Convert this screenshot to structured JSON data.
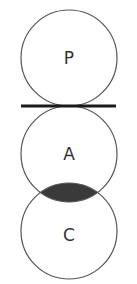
{
  "diagram": {
    "type": "stacked-circles",
    "circles": [
      {
        "label": "P",
        "cx": 69,
        "cy": 58,
        "r": 48
      },
      {
        "label": "A",
        "cx": 69,
        "cy": 154,
        "r": 48
      },
      {
        "label": "C",
        "cx": 69,
        "cy": 231,
        "r": 48
      }
    ],
    "tangent_line": {
      "x1": 21,
      "x2": 116,
      "y": 106,
      "between": [
        "P",
        "A"
      ]
    },
    "shaded_overlap": {
      "between": [
        "A",
        "C"
      ],
      "color": "#3a3a3a"
    },
    "stroke_color": "#555555",
    "line_color": "#1a1a1a"
  }
}
